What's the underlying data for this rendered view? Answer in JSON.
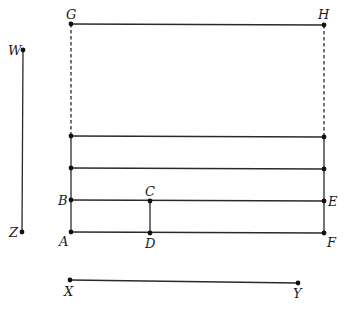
{
  "diagram": {
    "colors": {
      "line": "#2a2a2a",
      "point": "#111111",
      "label": "#1a1a1a"
    },
    "points": {
      "G": {
        "label": "G",
        "x": 71,
        "y": 24
      },
      "H": {
        "label": "H",
        "x": 324,
        "y": 25
      },
      "L1": {
        "label": "",
        "x": 71,
        "y": 136
      },
      "R1": {
        "label": "",
        "x": 324,
        "y": 137
      },
      "L2": {
        "label": "",
        "x": 71,
        "y": 168
      },
      "R2": {
        "label": "",
        "x": 324,
        "y": 169
      },
      "B": {
        "label": "B",
        "x": 71,
        "y": 200
      },
      "C": {
        "label": "C",
        "x": 150,
        "y": 201
      },
      "E": {
        "label": "E",
        "x": 324,
        "y": 201
      },
      "A": {
        "label": "A",
        "x": 71,
        "y": 232
      },
      "D": {
        "label": "D",
        "x": 150,
        "y": 233
      },
      "F": {
        "label": "F",
        "x": 324,
        "y": 233
      },
      "W": {
        "label": "W",
        "x": 23,
        "y": 50
      },
      "Z": {
        "label": "Z",
        "x": 22,
        "y": 232
      },
      "X": {
        "label": "X",
        "x": 70,
        "y": 280
      },
      "Y": {
        "label": "Y",
        "x": 298,
        "y": 283
      }
    },
    "segments": [
      {
        "from": "G",
        "to": "H",
        "style": "solid"
      },
      {
        "from": "G",
        "to": "L1",
        "style": "dashed"
      },
      {
        "from": "H",
        "to": "R1",
        "style": "dashed"
      },
      {
        "from": "L1",
        "to": "R1",
        "style": "solid"
      },
      {
        "from": "L2",
        "to": "R2",
        "style": "solid"
      },
      {
        "from": "B",
        "to": "E",
        "style": "solid"
      },
      {
        "from": "A",
        "to": "F",
        "style": "solid"
      },
      {
        "from": "L1",
        "to": "A",
        "style": "solid"
      },
      {
        "from": "R1",
        "to": "F",
        "style": "solid"
      },
      {
        "from": "C",
        "to": "D",
        "style": "solid"
      },
      {
        "from": "W",
        "to": "Z",
        "style": "solid"
      },
      {
        "from": "X",
        "to": "Y",
        "style": "solid"
      }
    ],
    "labels": {
      "G": "G",
      "H": "H",
      "W": "W",
      "Z": "Z",
      "B": "B",
      "C": "C",
      "E": "E",
      "A": "A",
      "D": "D",
      "F": "F",
      "X": "X",
      "Y": "Y"
    }
  }
}
